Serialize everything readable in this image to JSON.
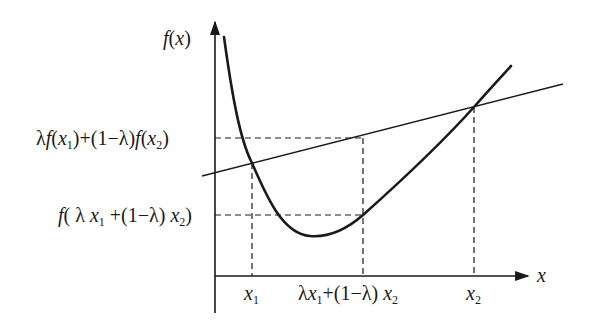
{
  "diagram": {
    "axes": {
      "y_label": "f(x)",
      "x_label": "x"
    },
    "y_ticks": [
      {
        "id": "chord_value",
        "label": "λf(x₁)+(1−λ)f(x₂)",
        "parts": {
          "lam": "λ",
          "f": "f",
          "open": "(",
          "x": "x",
          "sub1": "1",
          "mid": ")+(1−λ)",
          "f2": "f",
          "open2": "(",
          "x2": "x",
          "sub2": "2",
          "close": ")"
        }
      },
      {
        "id": "function_value",
        "label": "f(λx₁+(1−λ)x₂)",
        "parts": {
          "f": "f",
          "open": "( λ ",
          "x": "x",
          "sub1": "1",
          "mid": " +(1−λ) ",
          "x2": "x",
          "sub2": "2",
          "close": ")"
        }
      }
    ],
    "x_ticks": [
      {
        "id": "x1",
        "label": "x₁",
        "var": "x",
        "sub": "1"
      },
      {
        "id": "convex_combination",
        "label": "λx₁+(1−λ)x₂",
        "parts": {
          "lam": "λ",
          "x": "x",
          "sub1": "1",
          "mid": "+(1−λ) ",
          "x2": "x",
          "sub2": "2"
        }
      },
      {
        "id": "x2",
        "label": "x₂",
        "var": "x",
        "sub": "2"
      }
    ],
    "colors": {
      "line": "#1a1a1a",
      "background": "#ffffff"
    }
  }
}
